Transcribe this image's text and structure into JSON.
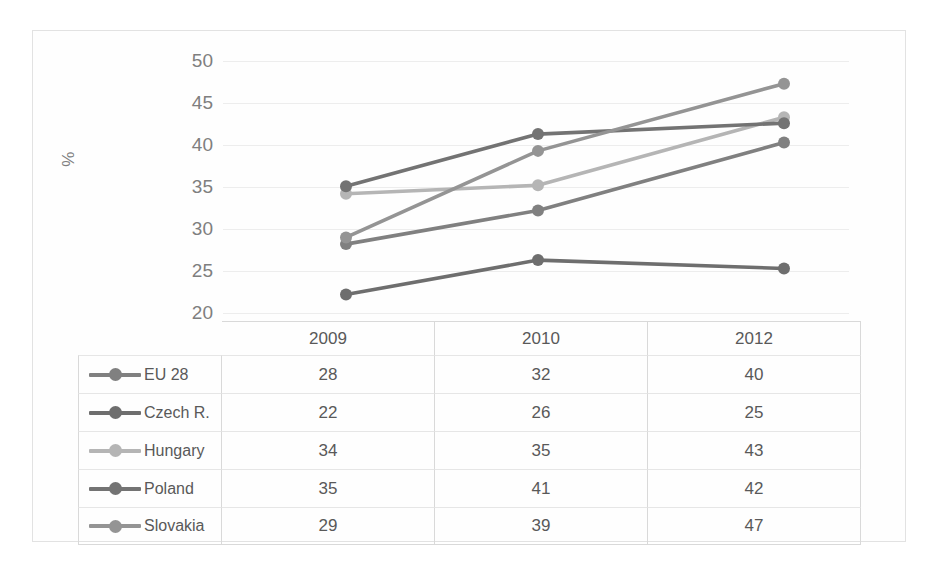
{
  "chart_data": {
    "type": "line",
    "title": "",
    "xlabel": "",
    "ylabel": "%",
    "categories": [
      "2009",
      "2010",
      "2012"
    ],
    "ylim": [
      20,
      50
    ],
    "yticks": [
      50,
      45,
      40,
      35,
      30,
      25,
      20
    ],
    "grid": true,
    "legend_position": "below-as-table",
    "series": [
      {
        "name": "EU 28",
        "values": [
          28,
          32,
          40
        ],
        "plotted": [
          28.2,
          32.2,
          40.3
        ],
        "color": "#808080"
      },
      {
        "name": "Czech R.",
        "values": [
          22,
          26,
          25
        ],
        "plotted": [
          22.2,
          26.3,
          25.3
        ],
        "color": "#6e6e6e"
      },
      {
        "name": "Hungary",
        "values": [
          34,
          35,
          43
        ],
        "plotted": [
          34.2,
          35.2,
          43.3
        ],
        "color": "#b5b5b5"
      },
      {
        "name": "Poland",
        "values": [
          35,
          41,
          42
        ],
        "plotted": [
          35.1,
          41.3,
          42.6
        ],
        "color": "#737373"
      },
      {
        "name": "Slovakia",
        "values": [
          29,
          39,
          47
        ],
        "plotted": [
          29.0,
          39.3,
          47.3
        ],
        "color": "#949494"
      }
    ]
  },
  "axis": {
    "y_label": "%",
    "tick_50": "50",
    "tick_45": "45",
    "tick_40": "40",
    "tick_35": "35",
    "tick_30": "30",
    "tick_25": "25",
    "tick_20": "20"
  },
  "table": {
    "header": {
      "blank": "",
      "y2009": "2009",
      "y2010": "2010",
      "y2012": "2012"
    },
    "rows": [
      {
        "name": "EU 28",
        "v2009": "28",
        "v2010": "32",
        "v2012": "40"
      },
      {
        "name": "Czech R.",
        "v2009": "22",
        "v2010": "26",
        "v2012": "25"
      },
      {
        "name": "Hungary",
        "v2009": "34",
        "v2010": "35",
        "v2012": "43"
      },
      {
        "name": "Poland",
        "v2009": "35",
        "v2010": "41",
        "v2012": "42"
      },
      {
        "name": "Slovakia",
        "v2009": "29",
        "v2010": "39",
        "v2012": "47"
      }
    ]
  },
  "colors": {
    "eu28": "#808080",
    "czech": "#6e6e6e",
    "hungary": "#b5b5b5",
    "poland": "#737373",
    "slovakia": "#949494",
    "gridline": "#ededed",
    "border": "#d9d9d9",
    "text": "#595959"
  }
}
